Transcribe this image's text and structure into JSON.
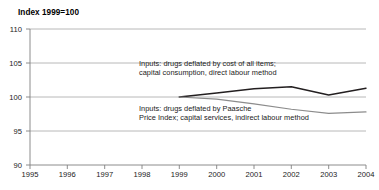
{
  "header": {
    "partial_cut_text": "",
    "axis_note": "Index 1999=100"
  },
  "annotations": {
    "upper_line1": "Inputs: drugs deflated by cost of all items;",
    "upper_line2": "capital consumption, direct labour method",
    "lower_line1": "Inputs: drugs deflated by Paasche",
    "lower_line2": "Price Index; capital services, indirect labour method"
  },
  "colors": {
    "series_dark": "#231f20",
    "series_grey": "#8c8c8c",
    "grid": "#a6a6a6",
    "axis": "#808080",
    "text": "#1a1a1a"
  },
  "chart_data": {
    "type": "line",
    "title": "",
    "subtitle": "",
    "xlabel": "",
    "ylabel": "Index 1999=100",
    "xlim": [
      1995,
      2004
    ],
    "ylim": [
      90,
      110
    ],
    "yticks": [
      90,
      95,
      100,
      105,
      110
    ],
    "xticks": [
      1995,
      1996,
      1997,
      1998,
      1999,
      2000,
      2001,
      2002,
      2003,
      2004
    ],
    "grid": true,
    "legend_position": "inline-annotation",
    "x": [
      1999,
      2000,
      2001,
      2002,
      2003,
      2004
    ],
    "series": [
      {
        "name": "Inputs: drugs deflated by cost of all items; capital consumption, direct labour method",
        "color": "#231f20",
        "values": [
          100.0,
          100.6,
          101.2,
          101.5,
          100.3,
          101.3
        ]
      },
      {
        "name": "Inputs: drugs deflated by Paasche Price Index; capital services, indirect labour method",
        "color": "#8c8c8c",
        "values": [
          100.0,
          99.7,
          99.0,
          98.2,
          97.6,
          97.8
        ]
      }
    ]
  }
}
